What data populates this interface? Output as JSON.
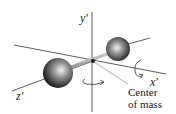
{
  "figure": {
    "axes": {
      "y_label": "y′",
      "x_label": "x′",
      "z_label": "z′"
    },
    "annotation": {
      "line1": "Center",
      "line2": "of mass"
    },
    "colors": {
      "axis": "#333333",
      "sphere_light": "#f2f2f2",
      "sphere_dark": "#1a1a1a",
      "background": "#ffffff"
    }
  }
}
